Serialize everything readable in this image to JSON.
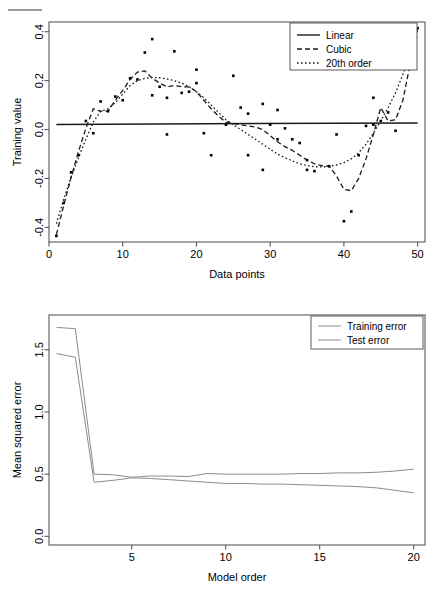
{
  "page": {
    "background": "#ffffff",
    "ink": "#000000",
    "rule_color": "#9a9a9a",
    "top_rule": "horizontal-rule-mark"
  },
  "figures": [
    {
      "id": "training-value-plot",
      "chart_data": {
        "type": "scatter",
        "title": "",
        "xlabel": "Data points",
        "ylabel": "Training value",
        "xlim": [
          0,
          51
        ],
        "ylim": [
          -0.46,
          0.44
        ],
        "xticks": [
          0,
          10,
          20,
          30,
          40,
          50
        ],
        "xtick_labels": [
          "0",
          "10",
          "20",
          "30",
          "40",
          "50"
        ],
        "yticks": [
          -0.4,
          -0.2,
          0.0,
          0.2,
          0.4
        ],
        "ytick_labels": [
          "-0.4",
          "-0.2",
          "0.0",
          "0.2",
          "0.4"
        ],
        "grid": false,
        "legend_position": "top-right",
        "legend": [
          {
            "label": "Linear",
            "style": "solid"
          },
          {
            "label": "Cubic",
            "style": "dashed"
          },
          {
            "label": "20th order",
            "style": "dotted"
          }
        ],
        "points": [
          [
            1,
            -0.435
          ],
          [
            2,
            -0.3
          ],
          [
            3,
            -0.175
          ],
          [
            4,
            -0.105
          ],
          [
            5,
            0.035
          ],
          [
            6,
            -0.015
          ],
          [
            7,
            0.115
          ],
          [
            8,
            0.075
          ],
          [
            9,
            0.135
          ],
          [
            10,
            0.12
          ],
          [
            11,
            0.21
          ],
          [
            12,
            0.205
          ],
          [
            13,
            0.315
          ],
          [
            14,
            0.37
          ],
          [
            14,
            0.14
          ],
          [
            15,
            0.175
          ],
          [
            16,
            0.13
          ],
          [
            16,
            -0.02
          ],
          [
            17,
            0.32
          ],
          [
            18,
            0.15
          ],
          [
            19,
            0.155
          ],
          [
            20,
            0.19
          ],
          [
            20,
            0.245
          ],
          [
            21,
            -0.015
          ],
          [
            22,
            -0.105
          ],
          [
            24,
            0.02
          ],
          [
            25,
            0.22
          ],
          [
            26,
            0.09
          ],
          [
            27,
            0.065
          ],
          [
            27,
            -0.105
          ],
          [
            29,
            0.105
          ],
          [
            29,
            -0.165
          ],
          [
            30,
            0.02
          ],
          [
            31,
            0.08
          ],
          [
            31,
            -0.04
          ],
          [
            32,
            0.005
          ],
          [
            33,
            -0.04
          ],
          [
            34,
            -0.055
          ],
          [
            35,
            -0.165
          ],
          [
            35,
            -0.125
          ],
          [
            36,
            -0.17
          ],
          [
            38,
            -0.15
          ],
          [
            39,
            -0.02
          ],
          [
            40,
            -0.375
          ],
          [
            41,
            -0.335
          ],
          [
            42,
            -0.105
          ],
          [
            43,
            0.015
          ],
          [
            44,
            0.02
          ],
          [
            44,
            0.13
          ],
          [
            45,
            0.035
          ],
          [
            46,
            0.07
          ],
          [
            47,
            -0.005
          ],
          [
            48,
            0.26
          ],
          [
            49,
            0.345
          ],
          [
            50,
            0.415
          ]
        ],
        "series": [
          {
            "name": "Linear",
            "style": "solid",
            "x": [
              1,
              50
            ],
            "y": [
              0.021,
              0.027
            ]
          },
          {
            "name": "20th order",
            "style": "dotted",
            "x": [
              1,
              2,
              3,
              4,
              5,
              6,
              7,
              8,
              9,
              10,
              11,
              12,
              13,
              14,
              15,
              16,
              17,
              18,
              19,
              20,
              21,
              22,
              23,
              24,
              25,
              26,
              27,
              28,
              29,
              30,
              31,
              32,
              33,
              34,
              35,
              36,
              37,
              38,
              39,
              40,
              41,
              42,
              43,
              44,
              45,
              46,
              47,
              48,
              49,
              50
            ],
            "y": [
              -0.385,
              -0.285,
              -0.195,
              -0.115,
              -0.04,
              0.03,
              0.075,
              0.085,
              0.11,
              0.145,
              0.18,
              0.2,
              0.21,
              0.213,
              0.212,
              0.207,
              0.2,
              0.19,
              0.175,
              0.155,
              0.13,
              0.1,
              0.07,
              0.04,
              0.02,
              0.0,
              -0.02,
              -0.04,
              -0.06,
              -0.08,
              -0.1,
              -0.115,
              -0.128,
              -0.14,
              -0.147,
              -0.152,
              -0.153,
              -0.15,
              -0.145,
              -0.135,
              -0.12,
              -0.095,
              -0.06,
              -0.015,
              0.035,
              0.09,
              0.15,
              0.225,
              0.305,
              0.39
            ]
          },
          {
            "name": "Cubic",
            "style": "dashed",
            "x": [
              1,
              2,
              3,
              4,
              5,
              6,
              7,
              8,
              9,
              10,
              11,
              12,
              13,
              14,
              15,
              16,
              17,
              18,
              19,
              20,
              21,
              22,
              23,
              24,
              25,
              26,
              27,
              28,
              29,
              30,
              31,
              32,
              33,
              34,
              35,
              36,
              37,
              38,
              39,
              40,
              41,
              42,
              43,
              44,
              45,
              46,
              47,
              48,
              49,
              50
            ],
            "y": [
              -0.43,
              -0.31,
              -0.195,
              -0.09,
              0.005,
              0.085,
              0.075,
              0.075,
              0.12,
              0.16,
              0.205,
              0.235,
              0.24,
              0.21,
              0.19,
              0.175,
              0.18,
              0.175,
              0.175,
              0.155,
              0.12,
              0.085,
              0.055,
              0.03,
              0.025,
              0.02,
              0.015,
              0.01,
              0.0,
              -0.025,
              -0.05,
              -0.07,
              -0.085,
              -0.105,
              -0.125,
              -0.14,
              -0.148,
              -0.15,
              -0.19,
              -0.245,
              -0.25,
              -0.2,
              -0.12,
              -0.02,
              0.09,
              0.035,
              0.04,
              0.12,
              0.27,
              0.41
            ]
          }
        ]
      }
    },
    {
      "id": "mean-squared-error-plot",
      "chart_data": {
        "type": "line",
        "title": "",
        "xlabel": "Model order",
        "ylabel": "Mean squared error",
        "xlim": [
          0.6,
          20.6
        ],
        "ylim": [
          -0.07,
          1.78
        ],
        "xticks": [
          5,
          10,
          15,
          20
        ],
        "xtick_labels": [
          "5",
          "10",
          "15",
          "20"
        ],
        "yticks": [
          0.0,
          0.5,
          1.0,
          1.5
        ],
        "ytick_labels": [
          "0.0",
          "0.5",
          "1.0",
          "1.5"
        ],
        "grid": false,
        "legend_position": "top-right",
        "legend": [
          {
            "label": "Training error",
            "style": "solid"
          },
          {
            "label": "Test error",
            "style": "solid"
          }
        ],
        "x": [
          1,
          2,
          3,
          4,
          5,
          6,
          7,
          8,
          9,
          10,
          11,
          12,
          13,
          14,
          15,
          16,
          17,
          18,
          19,
          20
        ],
        "series": [
          {
            "name": "Training error",
            "style": "solid",
            "values": [
              1.68,
              1.67,
              0.5,
              0.495,
              0.475,
              0.485,
              0.485,
              0.48,
              0.505,
              0.5,
              0.5,
              0.5,
              0.5,
              0.505,
              0.505,
              0.51,
              0.51,
              0.515,
              0.525,
              0.54
            ]
          },
          {
            "name": "Test error",
            "style": "solid",
            "values": [
              1.47,
              1.44,
              0.435,
              0.45,
              0.47,
              0.465,
              0.455,
              0.445,
              0.435,
              0.425,
              0.425,
              0.42,
              0.42,
              0.415,
              0.41,
              0.405,
              0.4,
              0.39,
              0.37,
              0.35
            ]
          }
        ]
      }
    }
  ]
}
